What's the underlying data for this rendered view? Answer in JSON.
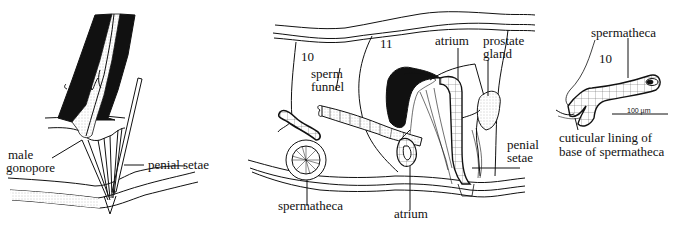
{
  "figure": {
    "panels": [
      {
        "id": "left",
        "labels": {
          "male_gonopore_1": "male",
          "male_gonopore_2": "gonopore",
          "penial_setae": "penial setae"
        }
      },
      {
        "id": "middle",
        "labels": {
          "segment_10": "10",
          "segment_11": "11",
          "sperm_funnel_1": "sperm",
          "sperm_funnel_2": "funnel",
          "atrium_top": "atrium",
          "prostate_1": "prostate",
          "prostate_2": "gland",
          "penial_1": "penial",
          "penial_2": "setae",
          "spermatheca": "spermatheca",
          "atrium_bottom": "atrium"
        }
      },
      {
        "id": "right",
        "labels": {
          "spermatheca": "spermatheca",
          "segment_10": "10",
          "scale_bar": "100 µm",
          "cuticular_1": "cuticular lining of",
          "cuticular_2": "base of spermatheca"
        }
      }
    ],
    "colors": {
      "ink": "#111111",
      "paper": "#ffffff",
      "stipple": "#cfcfcf"
    }
  }
}
